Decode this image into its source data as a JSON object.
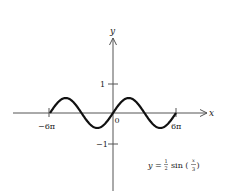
{
  "chart_data": {
    "type": "line",
    "title": "",
    "equation": "y = ½ sin (x/3)",
    "equation_parts": {
      "lhs": "y =",
      "coef_num": "1",
      "coef_den": "2",
      "func": "sin (",
      "arg_num": "x",
      "arg_den": "3",
      "close": ")"
    },
    "xlabel": "x",
    "ylabel": "y",
    "x_ticks": [
      {
        "value": -18.85,
        "label": "−6π"
      },
      {
        "value": 18.85,
        "label": "6π"
      }
    ],
    "y_ticks": [
      {
        "value": 1,
        "label": "1"
      },
      {
        "value": -1,
        "label": "−1"
      }
    ],
    "origin_label": "0",
    "domain": [
      -18.85,
      18.85
    ],
    "amplitude": 0.5,
    "period": 18.85,
    "series": [
      {
        "name": "y = 1/2 sin(x/3)",
        "x": [
          -18.85,
          -14.14,
          -9.42,
          -4.71,
          0,
          4.71,
          9.42,
          14.14,
          18.85
        ],
        "values": [
          0,
          0.5,
          0,
          -0.5,
          0,
          0.5,
          0,
          -0.5,
          0
        ]
      }
    ],
    "grid": false
  }
}
